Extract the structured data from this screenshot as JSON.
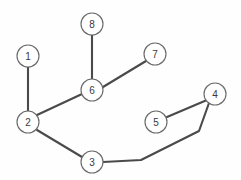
{
  "diagram": {
    "type": "graph",
    "width": 241,
    "height": 180,
    "background_color": "#fefefe",
    "node_fill_color": "#ffffff",
    "node_stroke_color": "#6b6b6b",
    "edge_color": "#4a4a4a",
    "label_color": "#3a3a3a",
    "node_radius": 11,
    "nodes": [
      {
        "id": "1",
        "label": "1",
        "x": 28,
        "y": 56
      },
      {
        "id": "2",
        "label": "2",
        "x": 28,
        "y": 122
      },
      {
        "id": "3",
        "label": "3",
        "x": 92,
        "y": 162
      },
      {
        "id": "4",
        "label": "4",
        "x": 215,
        "y": 94
      },
      {
        "id": "5",
        "label": "5",
        "x": 156,
        "y": 122
      },
      {
        "id": "6",
        "label": "6",
        "x": 92,
        "y": 90
      },
      {
        "id": "7",
        "label": "7",
        "x": 155,
        "y": 54
      },
      {
        "id": "8",
        "label": "8",
        "x": 92,
        "y": 24
      }
    ],
    "edges": [
      {
        "id": "e-1-2",
        "from": "1",
        "to": "2",
        "points": [
          [
            28,
            67
          ],
          [
            28,
            111
          ]
        ]
      },
      {
        "id": "e-2-6",
        "from": "2",
        "to": "6",
        "points": [
          [
            37,
            115
          ],
          [
            82,
            94
          ]
        ]
      },
      {
        "id": "e-6-8",
        "from": "6",
        "to": "8",
        "points": [
          [
            92,
            79
          ],
          [
            92,
            35
          ]
        ]
      },
      {
        "id": "e-6-7",
        "from": "6",
        "to": "7",
        "points": [
          [
            103,
            87
          ],
          [
            146,
            61
          ]
        ]
      },
      {
        "id": "e-2-3",
        "from": "2",
        "to": "3",
        "points": [
          [
            37,
            130
          ],
          [
            82,
            157
          ]
        ]
      },
      {
        "id": "e-3-4",
        "from": "3",
        "to": "4",
        "points": [
          [
            103,
            162
          ],
          [
            141,
            160
          ],
          [
            199,
            131
          ],
          [
            209,
            103
          ]
        ]
      },
      {
        "id": "e-5-4",
        "from": "5",
        "to": "4",
        "points": [
          [
            167,
            117
          ],
          [
            207,
            100
          ]
        ]
      }
    ]
  }
}
